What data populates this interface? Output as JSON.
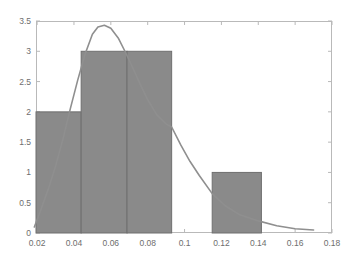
{
  "chart_data": {
    "type": "bar",
    "title": "",
    "subtitle": "",
    "xlabel": "",
    "ylabel": "",
    "xlim": [
      0.0194,
      0.18
    ],
    "ylim": [
      0,
      3.5
    ],
    "grid": false,
    "legend": false,
    "legend_position": "none",
    "xticks": [
      "0.02",
      "0.04",
      "0.06",
      "0.08",
      "0.1",
      "0.12",
      "0.14",
      "0.16",
      "0.18"
    ],
    "xtick_values": [
      0.02,
      0.04,
      0.06,
      0.08,
      0.1,
      0.12,
      0.14,
      0.16,
      0.18
    ],
    "yticks": [
      "0",
      "0.5",
      "1",
      "1.5",
      "2",
      "2.5",
      "3",
      "3.5"
    ],
    "ytick_values": [
      0,
      0.5,
      1,
      1.5,
      2,
      2.5,
      3,
      3.5
    ],
    "bar_color": "#8a8a8a",
    "bar_edge_color": "#6f6f6f",
    "curve_color": "#8f8f8f",
    "axis_color": "#b9b9b9",
    "tick_label_color": "#6e6e6e",
    "bins": [
      {
        "label": "0.019-0.044",
        "x0": 0.0194,
        "x1": 0.0439,
        "value": 2
      },
      {
        "label": "0.044-0.069",
        "x0": 0.0439,
        "x1": 0.0688,
        "value": 3
      },
      {
        "label": "0.069-0.093",
        "x0": 0.0688,
        "x1": 0.093,
        "value": 3
      },
      {
        "label": "0.093-0.115",
        "x0": 0.093,
        "x1": 0.115,
        "value": 0
      },
      {
        "label": "0.115-0.142",
        "x0": 0.115,
        "x1": 0.1417,
        "value": 1
      }
    ],
    "categories": [
      "0.019-0.044",
      "0.044-0.069",
      "0.069-0.093",
      "0.093-0.115",
      "0.115-0.142"
    ],
    "values": [
      2,
      3,
      3,
      0,
      1
    ],
    "series": [
      {
        "name": "fitted-density-curve",
        "type": "line",
        "x": [
          0.0185,
          0.022,
          0.026,
          0.03,
          0.034,
          0.038,
          0.042,
          0.046,
          0.05,
          0.053,
          0.0565,
          0.06,
          0.064,
          0.068,
          0.072,
          0.076,
          0.08,
          0.085,
          0.09,
          0.093,
          0.098,
          0.103,
          0.108,
          0.115,
          0.122,
          0.13,
          0.14,
          0.15,
          0.16,
          0.17
        ],
        "y": [
          0.1,
          0.38,
          0.72,
          1.1,
          1.55,
          2.05,
          2.52,
          2.95,
          3.28,
          3.4,
          3.43,
          3.38,
          3.22,
          2.98,
          2.72,
          2.45,
          2.2,
          1.95,
          1.8,
          1.75,
          1.45,
          1.18,
          0.95,
          0.65,
          0.45,
          0.3,
          0.2,
          0.12,
          0.07,
          0.05
        ]
      }
    ]
  }
}
